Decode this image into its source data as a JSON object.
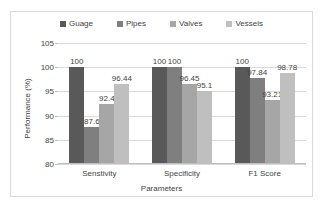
{
  "chart_data": {
    "type": "bar",
    "title": "",
    "xlabel": "Parameters",
    "ylabel": "Performance (%)",
    "ylim": [
      80,
      105
    ],
    "yticks": [
      80,
      85,
      90,
      95,
      100,
      105
    ],
    "grid": true,
    "legend_position": "top",
    "categories": [
      "Senstivity",
      "Specificity",
      "F1 Score"
    ],
    "series": [
      {
        "name": "Guage",
        "color": "#595959",
        "values": [
          100,
          100,
          100
        ]
      },
      {
        "name": "Pipes",
        "color": "#7f7f7f",
        "values": [
          87.6,
          100,
          97.84
        ]
      },
      {
        "name": "Valves",
        "color": "#a6a6a6",
        "values": [
          92.4,
          96.45,
          93.21
        ]
      },
      {
        "name": "Vessels",
        "color": "#bfbfbf",
        "values": [
          96.44,
          95.1,
          98.78
        ]
      }
    ],
    "value_labels": [
      [
        "100",
        "87.6",
        "92.4",
        "96.44"
      ],
      [
        "100",
        "100",
        "96.45",
        "95.1"
      ],
      [
        "100",
        "97.84",
        "93.21",
        "98.78"
      ]
    ],
    "ytick_labels": [
      "105",
      "100",
      "95",
      "90",
      "85",
      "80"
    ]
  }
}
